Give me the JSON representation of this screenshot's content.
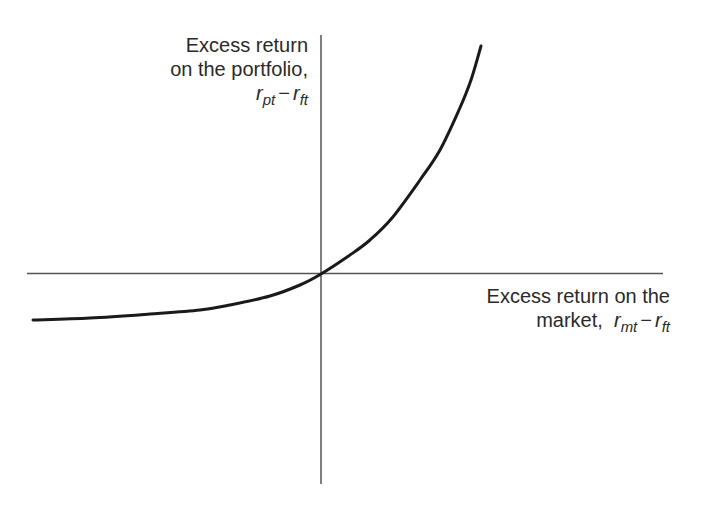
{
  "y_axis": {
    "label_line1": "Excess return",
    "label_line2": "on the portfolio,",
    "symbol": {
      "r1": "r",
      "sub1": "pt",
      "op": "−",
      "r2": "r",
      "sub2": "ft"
    }
  },
  "x_axis": {
    "label_line1": "Excess return on the",
    "label_line2": "market,",
    "symbol": {
      "r1": "r",
      "sub1": "mt",
      "op": "−",
      "r2": "r",
      "sub2": "ft"
    }
  },
  "colors": {
    "axis": "#555555",
    "curve": "#1a1a1a",
    "text": "#2a2a2a"
  },
  "chart_data": {
    "type": "line",
    "title": "",
    "xlabel": "Excess return on the market, r_mt − r_ft",
    "ylabel": "Excess return on the portfolio, r_pt − r_ft",
    "grid": false,
    "origin_px": [
      321,
      274
    ],
    "x_axis_px": [
      27,
      663
    ],
    "y_axis_px": [
      35,
      484
    ],
    "curve_points_px": [
      [
        33,
        320
      ],
      [
        90,
        318
      ],
      [
        150,
        314
      ],
      [
        200,
        310
      ],
      [
        230,
        305
      ],
      [
        270,
        296
      ],
      [
        300,
        285
      ],
      [
        321,
        274
      ],
      [
        350,
        255
      ],
      [
        370,
        240
      ],
      [
        392,
        218
      ],
      [
        420,
        180
      ],
      [
        440,
        150
      ],
      [
        459,
        110
      ],
      [
        471,
        80
      ],
      [
        481,
        46
      ]
    ]
  }
}
